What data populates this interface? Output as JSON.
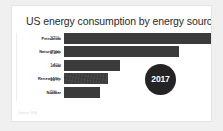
{
  "card": {
    "title": "US energy consumption by energy source",
    "source_note": "Source: EIA",
    "badge_label": "2017",
    "accent_color": "#3b3b3b",
    "badge_color": "#242424",
    "card_background": "#ffffff",
    "page_background": "#f0f0f0"
  },
  "chart_data": {
    "type": "bar",
    "orientation": "horizontal",
    "title": "US energy consumption by energy source",
    "xlabel": "",
    "ylabel": "",
    "grid": false,
    "legend": null,
    "xlim": [
      0,
      40
    ],
    "annotations": [
      "2017"
    ],
    "categories": [
      "Petroleum",
      "Natural gas",
      "Coal",
      "Renewables",
      "Nuclear"
    ],
    "values": [
      37,
      29,
      14,
      11,
      9
    ],
    "value_labels": [
      "37%",
      "29%",
      "14%",
      "11%",
      "9%"
    ],
    "rows": [
      {
        "label": "Petroleum",
        "value": 37,
        "value_label": "37%",
        "bar_width_pct": 100.0,
        "textured": false
      },
      {
        "label": "Natural gas",
        "value": 29,
        "value_label": "29%",
        "bar_width_pct": 78.5,
        "textured": false
      },
      {
        "label": "Coal",
        "value": 14,
        "value_label": "14%",
        "bar_width_pct": 37.8,
        "textured": false
      },
      {
        "label": "Renewables",
        "value": 11,
        "value_label": "11%",
        "bar_width_pct": 29.7,
        "textured": true
      },
      {
        "label": "Nuclear",
        "value": 9,
        "value_label": "9%",
        "bar_width_pct": 24.3,
        "textured": false
      }
    ]
  }
}
